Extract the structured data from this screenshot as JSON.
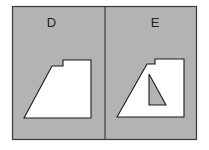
{
  "colors": {
    "background": "#ffffff",
    "panel_fill": "#b3b3b3",
    "border": "#3a3a3a",
    "shape_fill": "#ffffff",
    "shape_stroke": "#1a1a1a",
    "hole_fill": "#b3b3b3"
  },
  "panels": [
    {
      "label": "D",
      "shape": "trapezoid with notched top edge",
      "has_triangle_hole": false
    },
    {
      "label": "E",
      "shape": "trapezoid with notched top edge",
      "has_triangle_hole": true
    }
  ]
}
